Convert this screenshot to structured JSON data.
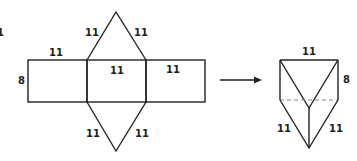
{
  "net": {
    "top_triangle_left": "11",
    "top_triangle_right": "11",
    "left_rect_top": "11",
    "left_rect_height": "8",
    "center_rect_top": "11",
    "right_rect_top": "11",
    "bottom_triangle_left": "11",
    "bottom_triangle_right": "11"
  },
  "prism": {
    "top_edge": "11",
    "side_height": "8",
    "bottom_left_edge": "11",
    "bottom_right_edge": "11"
  },
  "colors": {
    "stroke": "#222222",
    "hidden_edge": "#888888"
  },
  "corner_mark": "1"
}
